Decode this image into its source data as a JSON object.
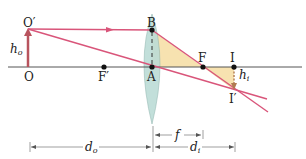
{
  "diagram": {
    "points": {
      "object_base": "O",
      "object_tip": "O′",
      "front_focus": "F′",
      "lens_center": "A",
      "lens_top": "B",
      "back_focus": "F",
      "image_base": "I",
      "image_tip": "I′"
    },
    "heights": {
      "object": "h",
      "object_sub": "o",
      "image": "h",
      "image_sub": "i"
    },
    "distances": {
      "object_distance": "d",
      "object_distance_sub": "o",
      "image_distance": "d",
      "image_distance_sub": "i",
      "focal_length": "f"
    },
    "colors": {
      "ray": "#d9557a",
      "object_arrow": "#b8545e",
      "lens": "#bcdcd6",
      "triangle_fill": "#f7e2b0",
      "axis": "#555555",
      "image_arrow": "#b07a50"
    }
  }
}
